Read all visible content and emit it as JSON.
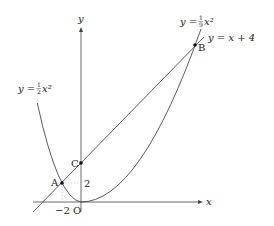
{
  "figure": {
    "axes": {
      "x_label": "x",
      "y_label": "y",
      "origin_label": "O",
      "x_tick_label": "−2",
      "y_tick_label": "2"
    },
    "curves": [
      {
        "id": "parabola_half",
        "equation": "y = ½ x²",
        "label_prefix": "y = ",
        "frac_num": "1",
        "frac_den": "2",
        "label_suffix": "x²"
      },
      {
        "id": "parabola_ninth",
        "equation": "y = ⅑ x²",
        "label_prefix": "y = ",
        "frac_num": "1",
        "frac_den": "9",
        "label_suffix": "x²"
      },
      {
        "id": "line",
        "equation": "y = x + 4",
        "label": "y = x + 4"
      }
    ],
    "points": [
      {
        "name": "A",
        "x": -2,
        "y": 2
      },
      {
        "name": "B",
        "x": 12,
        "y": 16
      },
      {
        "name": "C",
        "x": 0,
        "y": 4
      }
    ],
    "colors": {
      "stroke": "#333333",
      "guide": "#bbbbbb",
      "background": "#ffffff"
    }
  }
}
